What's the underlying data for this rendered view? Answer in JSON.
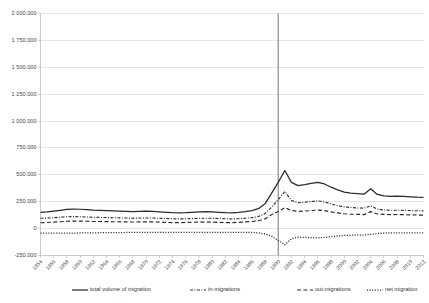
{
  "chart_data": {
    "type": "line",
    "title": "",
    "xlabel": "",
    "ylabel": "",
    "ylim": [
      -250000,
      2000000
    ],
    "ytick_values": [
      2000000,
      1750000,
      1500000,
      1250000,
      1000000,
      750000,
      500000,
      250000,
      0,
      -250000
    ],
    "ytick_labels": [
      "2 000.000",
      "1 750.000",
      "1 500.000",
      "1 250.000",
      "1 000.000",
      "750.000",
      "500.000",
      "250.000",
      "0",
      "-250.000"
    ],
    "grid": true,
    "legend_position": "bottom",
    "annotations": [
      {
        "name": "reference-line-1990",
        "type": "vline",
        "x": 1990
      }
    ],
    "x": [
      1954,
      1955,
      1956,
      1957,
      1958,
      1959,
      1960,
      1961,
      1962,
      1963,
      1964,
      1965,
      1966,
      1967,
      1968,
      1969,
      1970,
      1971,
      1972,
      1973,
      1974,
      1975,
      1976,
      1977,
      1978,
      1979,
      1980,
      1981,
      1982,
      1983,
      1984,
      1985,
      1986,
      1987,
      1988,
      1989,
      1990,
      1991,
      1992,
      1993,
      1994,
      1995,
      1996,
      1997,
      1998,
      1999,
      2000,
      2001,
      2002,
      2003,
      2004,
      2005,
      2006,
      2007,
      2008,
      2009,
      2010,
      2011,
      2012
    ],
    "xtick_labels": [
      "1954",
      "1956",
      "1958",
      "1960",
      "1962",
      "1964",
      "1966",
      "1968",
      "1970",
      "1972",
      "1974",
      "1976",
      "1978",
      "1980",
      "1982",
      "1984",
      "1986",
      "1988",
      "1990",
      "1992",
      "1994",
      "1996",
      "1998",
      "2000",
      "2002",
      "2004",
      "2006",
      "2008",
      "2010",
      "2012"
    ],
    "series": [
      {
        "name": "total volume of migration",
        "style": "solid",
        "values": [
          150000,
          155000,
          162000,
          170000,
          178000,
          182000,
          180000,
          176000,
          172000,
          170000,
          168000,
          165000,
          163000,
          160000,
          158000,
          160000,
          162000,
          160000,
          156000,
          152000,
          148000,
          146000,
          148000,
          152000,
          156000,
          158000,
          156000,
          152000,
          148000,
          146000,
          150000,
          158000,
          168000,
          185000,
          230000,
          330000,
          430000,
          540000,
          430000,
          400000,
          408000,
          420000,
          430000,
          415000,
          385000,
          360000,
          340000,
          330000,
          325000,
          320000,
          370000,
          318000,
          305000,
          300000,
          302000,
          300000,
          296000,
          292000,
          290000
        ]
      },
      {
        "name": "in-migrations",
        "style": "dashdot",
        "values": [
          96000,
          98000,
          102000,
          106000,
          110000,
          112000,
          110000,
          108000,
          106000,
          104000,
          103000,
          101000,
          100000,
          98000,
          97000,
          98000,
          99000,
          98000,
          96000,
          94000,
          92000,
          90000,
          91000,
          93000,
          96000,
          97000,
          96000,
          94000,
          92000,
          90000,
          92000,
          96000,
          102000,
          112000,
          140000,
          200000,
          270000,
          345000,
          262000,
          240000,
          245000,
          252000,
          258000,
          248000,
          230000,
          214000,
          202000,
          196000,
          192000,
          190000,
          212000,
          182000,
          173000,
          170000,
          171000,
          170000,
          168000,
          166000,
          165000
        ]
      },
      {
        "name": "out-migrations",
        "style": "dashed",
        "values": [
          54000,
          57000,
          60000,
          64000,
          68000,
          70000,
          70000,
          68000,
          66000,
          66000,
          65000,
          64000,
          63000,
          62000,
          61000,
          62000,
          63000,
          62000,
          60000,
          58000,
          56000,
          56000,
          57000,
          59000,
          60000,
          61000,
          60000,
          58000,
          56000,
          56000,
          58000,
          62000,
          66000,
          73000,
          90000,
          130000,
          160000,
          195000,
          168000,
          160000,
          163000,
          168000,
          172000,
          167000,
          155000,
          146000,
          138000,
          134000,
          133000,
          130000,
          158000,
          136000,
          132000,
          130000,
          131000,
          130000,
          128000,
          126000,
          125000
        ]
      },
      {
        "name": "net migration",
        "style": "dotted",
        "values": [
          -42000,
          -41000,
          -42000,
          -42000,
          -42000,
          -42000,
          -40000,
          -40000,
          -40000,
          -38000,
          -38000,
          -37000,
          -37000,
          -36000,
          -36000,
          -36000,
          -36000,
          -36000,
          -36000,
          -36000,
          -36000,
          -34000,
          -34000,
          -34000,
          -36000,
          -36000,
          -36000,
          -36000,
          -36000,
          -34000,
          -34000,
          -34000,
          -36000,
          -39000,
          -50000,
          -70000,
          -110000,
          -150000,
          -94000,
          -80000,
          -82000,
          -84000,
          -86000,
          -81000,
          -75000,
          -68000,
          -64000,
          -62000,
          -59000,
          -60000,
          -54000,
          -46000,
          -41000,
          -40000,
          -40000,
          -40000,
          -40000,
          -40000,
          -40000
        ]
      }
    ]
  },
  "legend": {
    "items": [
      {
        "label": "total volume of migration",
        "style": "solid"
      },
      {
        "label": "in-migrations",
        "style": "dashdot"
      },
      {
        "label": "out-migrations",
        "style": "dashed"
      },
      {
        "label": "net migration",
        "style": "dotted"
      }
    ]
  },
  "colors": {
    "series": "#2b2b2b",
    "grid": "#d9d9d9",
    "axis": "#bfbfbf",
    "reference_line": "#808080",
    "background": "#ffffff"
  }
}
